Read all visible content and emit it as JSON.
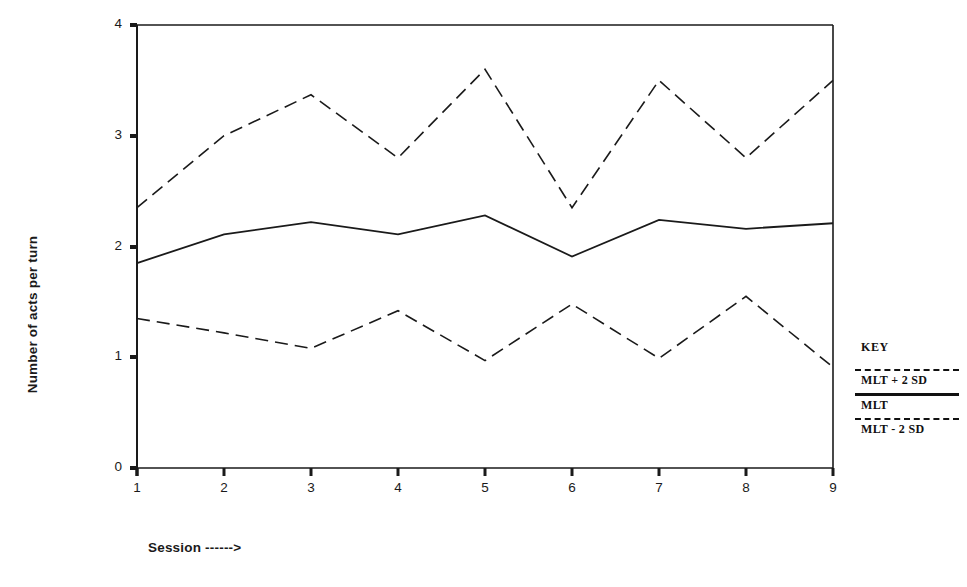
{
  "chart_data": {
    "type": "line",
    "title": "",
    "xlabel": "Session ------>",
    "ylabel": "Number of acts per turn",
    "xlim": [
      1,
      9
    ],
    "ylim": [
      0,
      4
    ],
    "grid": false,
    "x": [
      1,
      2,
      3,
      4,
      5,
      6,
      7,
      8,
      9
    ],
    "xtick_labels": [
      "1",
      "2",
      "3",
      "4",
      "5",
      "6",
      "7",
      "8",
      "9"
    ],
    "ytick_labels": [
      "0",
      "1",
      "2",
      "3",
      "4"
    ],
    "ytick_values": [
      0,
      1,
      2,
      3,
      4
    ],
    "series": [
      {
        "name": "MLT + 2 SD",
        "style": "dashed",
        "values": [
          2.35,
          3.0,
          3.37,
          2.8,
          3.6,
          2.35,
          3.5,
          2.8,
          3.5
        ]
      },
      {
        "name": "MLT",
        "style": "solid",
        "values": [
          1.85,
          2.11,
          2.22,
          2.11,
          2.28,
          1.91,
          2.24,
          2.16,
          2.21
        ]
      },
      {
        "name": "MLT - 2 SD",
        "style": "dashed",
        "values": [
          1.35,
          1.22,
          1.08,
          1.42,
          0.97,
          1.48,
          0.99,
          1.55,
          0.91
        ]
      }
    ],
    "legend_position": "right",
    "line_color": "#1a1a1a"
  },
  "legend": {
    "title": "KEY",
    "entries": [
      {
        "label": "MLT + 2 SD",
        "style": "dashed"
      },
      {
        "label": "MLT",
        "style": "solid"
      },
      {
        "label": "MLT - 2 SD",
        "style": "dashed"
      }
    ]
  },
  "axes": {
    "y_label": "Number of acts per turn",
    "x_title": "Session ------>",
    "y_ticks": [
      "0",
      "1",
      "2",
      "3",
      "4"
    ],
    "x_ticks": [
      "1",
      "2",
      "3",
      "4",
      "5",
      "6",
      "7",
      "8",
      "9"
    ]
  }
}
